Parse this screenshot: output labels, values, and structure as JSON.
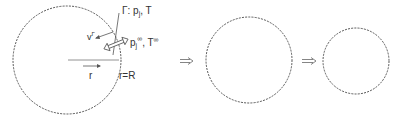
{
  "diagram": {
    "stages": [
      {
        "id": "stage-1",
        "cx": 67,
        "cy": 60,
        "r": 54
      },
      {
        "id": "stage-2",
        "cx": 249,
        "cy": 60,
        "r": 43
      },
      {
        "id": "stage-3",
        "cx": 356,
        "cy": 61,
        "r": 33
      }
    ],
    "labels": {
      "interface": "Γ: p",
      "interface_sub": "j",
      "interface_T": ", T",
      "velocity": "v",
      "velocity_sup": "Γ",
      "far_field": "p",
      "far_field_sub": "j",
      "far_field_sup": "∞",
      "far_field_T": ", T",
      "far_field_T_sup": "∞",
      "radius": "r",
      "boundary": "r=R"
    },
    "arrows": [
      {
        "id": "transition-arrow-1",
        "symbol": "⟹"
      },
      {
        "id": "transition-arrow-2",
        "symbol": "⟹"
      }
    ],
    "colors": {
      "stroke": "#555555",
      "text": "#333333"
    }
  }
}
